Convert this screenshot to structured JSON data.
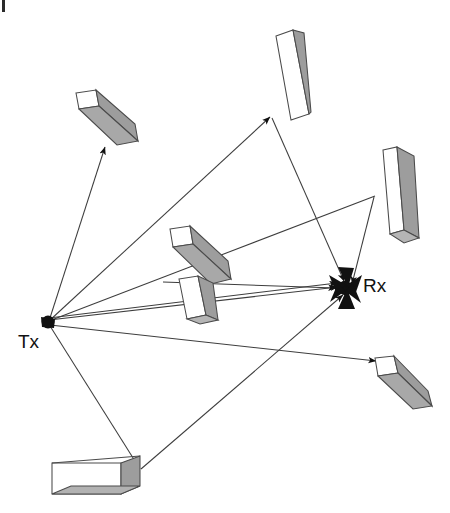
{
  "figure": {
    "type": "multipath-propagation-diagram",
    "background_color": "#ffffff",
    "width": 450,
    "height": 513,
    "stroke_color": "#3a3a3a",
    "fill_white": "#ffffff",
    "fill_gray": "#9a9a9a",
    "fill_gray_dark": "#8a8a8a",
    "marker_color": "#111111"
  },
  "nodes": [
    {
      "id": "tx",
      "label": "Tx",
      "icon": "filled-circle-marker",
      "x": 48,
      "y": 322,
      "label_x": 18,
      "label_y": 331
    },
    {
      "id": "rx",
      "label": "Rx",
      "icon": "star-burst-marker",
      "x": 345,
      "y": 288,
      "label_x": 363,
      "label_y": 275
    }
  ],
  "buildings": [
    {
      "id": "building-top-left",
      "name": "top-left-block",
      "orientation": "diagonal-down-right"
    },
    {
      "id": "building-top",
      "name": "top-block",
      "orientation": "vertical-tilted"
    },
    {
      "id": "building-right",
      "name": "right-block",
      "orientation": "vertical-tilted"
    },
    {
      "id": "building-center",
      "name": "center-block",
      "orientation": "diagonal-down-right"
    },
    {
      "id": "building-center-lower",
      "name": "center-lower-block",
      "orientation": "vertical-tilted"
    },
    {
      "id": "building-lower-right",
      "name": "lower-right-block",
      "orientation": "diagonal-down-right"
    },
    {
      "id": "building-bottom",
      "name": "bottom-block",
      "orientation": "horizontal"
    }
  ],
  "rays": [
    {
      "id": "ray-tx-to-top-left",
      "from": "tx",
      "to": "building-top-left",
      "arrow": true
    },
    {
      "id": "ray-tx-to-top",
      "from": "tx",
      "to": "building-top",
      "arrow": true
    },
    {
      "id": "ray-tx-to-right",
      "from": "tx",
      "to": "building-right",
      "arrow": false
    },
    {
      "id": "ray-right-to-rx",
      "from": "building-right",
      "to": "rx",
      "arrow": true
    },
    {
      "id": "ray-top-to-rx",
      "from": "building-top",
      "to": "rx",
      "arrow": true
    },
    {
      "id": "ray-tx-direct-rx-a",
      "from": "tx",
      "to": "rx",
      "arrow": true
    },
    {
      "id": "ray-tx-direct-rx-b",
      "from": "tx",
      "to": "rx",
      "arrow": true
    },
    {
      "id": "ray-tx-to-lower-right",
      "from": "tx",
      "to": "building-lower-right",
      "arrow": true
    },
    {
      "id": "ray-tx-to-bottom",
      "from": "tx",
      "to": "building-bottom",
      "arrow": false
    },
    {
      "id": "ray-bottom-to-rx",
      "from": "building-bottom",
      "to": "rx",
      "arrow": true
    },
    {
      "id": "ray-center-to-rx",
      "from": "building-center",
      "to": "rx",
      "arrow": true
    }
  ],
  "annotations": {
    "scan_artifact": "black-edge-mark-top-left"
  }
}
